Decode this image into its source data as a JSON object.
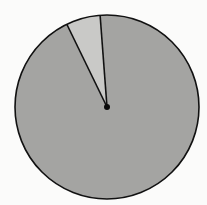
{
  "chart_data": {
    "type": "pie",
    "title": "",
    "categories": [
      "Small slice",
      "Large slice"
    ],
    "values": [
      6,
      94
    ],
    "colors": [
      "#c9c9c7",
      "#a4a4a2"
    ],
    "start_angle_deg": -4.3,
    "direction": "counterclockwise",
    "legend": null,
    "labels_visible": false
  },
  "style": {
    "background": "#fbfbfa",
    "outline_color": "#111111",
    "outline_width": 1.6,
    "center_dot_color": "#0a0a0a",
    "center_dot_radius": 3
  },
  "geometry": {
    "cx": 107,
    "cy": 107,
    "r": 92
  }
}
